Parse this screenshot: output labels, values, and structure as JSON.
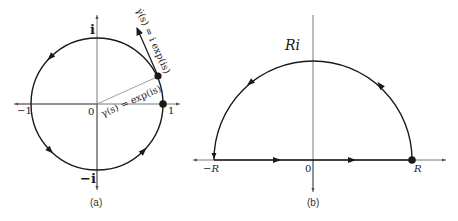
{
  "panel_a": {
    "caption": "(a)",
    "label_i": "i",
    "label_neg_i": "−i",
    "label_neg_one": "−1",
    "label_one": "1",
    "label_origin": "0",
    "label_gamma": "γ(s) = exp(is)",
    "label_gamma_dot": "γ̇(s) = i exp(is)"
  },
  "panel_b": {
    "caption": "(b)",
    "label_Ri": "Ri",
    "label_neg_R": "−R",
    "label_R": "R",
    "label_origin": "0"
  },
  "colors": {
    "stroke": "#1a1a1a",
    "axis": "#555555",
    "background": "#ffffff"
  }
}
